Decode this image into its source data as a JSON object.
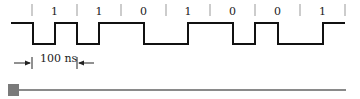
{
  "diagram": {
    "type": "manchester-timing-diagram",
    "bits": [
      "1",
      "1",
      "0",
      "1",
      "0",
      "0",
      "1"
    ],
    "tick_positions": [
      32,
      77,
      121,
      166,
      210,
      255,
      300,
      345
    ],
    "levels": {
      "high_y": 23,
      "low_y": 44
    },
    "waveform_points": [
      [
        11,
        23
      ],
      [
        33,
        23
      ],
      [
        33,
        44
      ],
      [
        55,
        44
      ],
      [
        55,
        23
      ],
      [
        77,
        23
      ],
      [
        77,
        44
      ],
      [
        99,
        44
      ],
      [
        99,
        23
      ],
      [
        144,
        23
      ],
      [
        144,
        44
      ],
      [
        188,
        44
      ],
      [
        188,
        23
      ],
      [
        233,
        23
      ],
      [
        233,
        44
      ],
      [
        255,
        44
      ],
      [
        255,
        23
      ],
      [
        278,
        23
      ],
      [
        278,
        44
      ],
      [
        323,
        44
      ],
      [
        323,
        23
      ],
      [
        345,
        23
      ]
    ],
    "bit_period_label": "100 ns",
    "colors": {
      "line": "#111111",
      "tick": "#999999",
      "text": "#222222"
    }
  },
  "slider": {
    "value": 0,
    "track_color": "#8a8a8a",
    "thumb_color": "#7a7a7a"
  }
}
